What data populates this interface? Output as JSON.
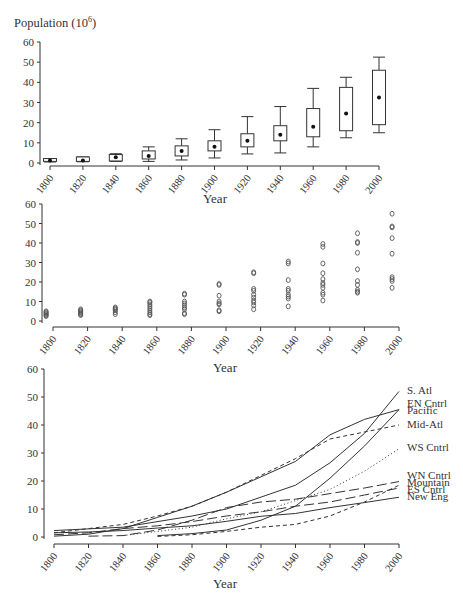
{
  "figure": {
    "title_text": "Population (10",
    "title_exp": "6",
    "title_close": ")"
  },
  "chart_data": [
    {
      "id": "boxplot",
      "type": "box",
      "title": "Population (10^6)",
      "xlabel": "Year",
      "ylabel": "Population (10^6)",
      "ylim": [
        0,
        60
      ],
      "yticks": [
        0,
        10,
        20,
        30,
        40,
        50,
        60
      ],
      "xticks": [
        1800,
        1820,
        1840,
        1860,
        1880,
        1900,
        1920,
        1940,
        1960,
        1980,
        2000
      ],
      "grid": false,
      "boxes": [
        {
          "x": 1800,
          "min": 0.5,
          "q1": 0.8,
          "mean": 1.2,
          "q3": 2.2,
          "max": 2.2
        },
        {
          "x": 1820,
          "min": 0.6,
          "q1": 0.8,
          "mean": 1.3,
          "q3": 3.0,
          "max": 3.0
        },
        {
          "x": 1840,
          "min": 0.8,
          "q1": 1.0,
          "mean": 2.8,
          "q3": 4.2,
          "max": 4.6
        },
        {
          "x": 1860,
          "min": 0.8,
          "q1": 2.0,
          "mean": 3.5,
          "q3": 6.0,
          "max": 8.0
        },
        {
          "x": 1880,
          "min": 1.5,
          "q1": 3.5,
          "mean": 6.0,
          "q3": 8.5,
          "max": 12.0
        },
        {
          "x": 1900,
          "min": 2.5,
          "q1": 6.0,
          "mean": 8.0,
          "q3": 11.0,
          "max": 16.5
        },
        {
          "x": 1920,
          "min": 4.5,
          "q1": 8.0,
          "mean": 11.0,
          "q3": 14.5,
          "max": 23.0
        },
        {
          "x": 1940,
          "min": 5.0,
          "q1": 11.0,
          "mean": 14.0,
          "q3": 18.5,
          "max": 28.0
        },
        {
          "x": 1960,
          "min": 8.0,
          "q1": 13.0,
          "mean": 18.0,
          "q3": 27.0,
          "max": 37.0
        },
        {
          "x": 1980,
          "min": 12.5,
          "q1": 16.0,
          "mean": 24.5,
          "q3": 37.5,
          "max": 42.5
        },
        {
          "x": 2000,
          "min": 15.0,
          "q1": 19.0,
          "mean": 32.5,
          "q3": 46.0,
          "max": 52.5
        }
      ],
      "layout": {
        "x0": 50,
        "x1": 379,
        "xaxis_y": 166,
        "yaxis_x": 40,
        "y_at_0": 163,
        "y_at_60": 42,
        "xlabel_x": 215,
        "xlabel_y": 203
      }
    },
    {
      "id": "scatter",
      "type": "scatter",
      "xlabel": "Year",
      "ylim": [
        0,
        60
      ],
      "yticks": [
        0,
        10,
        20,
        30,
        40,
        50,
        60
      ],
      "xticks": [
        1800,
        1820,
        1840,
        1860,
        1880,
        1900,
        1920,
        1940,
        1960,
        1980,
        2000
      ],
      "grid": false,
      "marker": "open-circle",
      "points": [
        {
          "x": 1796,
          "y": [
            2.5,
            3.0,
            3.5,
            4.0,
            4.5,
            5.0
          ]
        },
        {
          "x": 1816,
          "y": [
            3.0,
            3.5,
            4.0,
            4.5,
            5.0,
            5.5,
            6.0
          ]
        },
        {
          "x": 1836,
          "y": [
            3.5,
            4.5,
            5.5,
            6.0,
            6.5,
            7.0
          ]
        },
        {
          "x": 1856,
          "y": [
            3.0,
            3.5,
            4.5,
            5.5,
            6.5,
            7.5,
            8.5,
            9.5,
            10.0
          ]
        },
        {
          "x": 1876,
          "y": [
            3.5,
            4.0,
            6.0,
            7.0,
            8.0,
            9.0,
            10.0,
            13.5,
            14.0
          ]
        },
        {
          "x": 1896,
          "y": [
            5.0,
            5.5,
            8.5,
            9.0,
            10.0,
            13.0,
            18.5,
            19.0
          ]
        },
        {
          "x": 1916,
          "y": [
            6.0,
            8.0,
            9.5,
            10.5,
            12.0,
            13.5,
            15.5,
            16.5,
            24.5,
            25.0
          ]
        },
        {
          "x": 1936,
          "y": [
            7.5,
            11.5,
            12.5,
            13.5,
            15.5,
            16.5,
            21.0,
            29.5,
            30.5
          ]
        },
        {
          "x": 1956,
          "y": [
            10.5,
            13.5,
            14.5,
            17.0,
            18.5,
            19.5,
            21.5,
            24.5,
            29.5,
            38.0,
            39.5
          ]
        },
        {
          "x": 1976,
          "y": [
            14.5,
            15.0,
            16.0,
            18.5,
            20.5,
            26.5,
            35.0,
            40.0,
            40.5,
            45.0
          ]
        },
        {
          "x": 1996,
          "y": [
            17.0,
            20.5,
            21.5,
            22.5,
            34.5,
            42.5,
            48.0,
            48.5,
            55.0
          ]
        }
      ],
      "layout": {
        "x0": 53,
        "x1": 399,
        "xaxis_y": 327,
        "yaxis_x": 42,
        "y_at_0": 321,
        "y_at_60": 204,
        "xlabel_x": 225,
        "xlabel_y": 372
      }
    },
    {
      "id": "lines",
      "type": "line",
      "xlabel": "Year",
      "ylim": [
        0,
        60
      ],
      "yticks": [
        0,
        10,
        20,
        30,
        40,
        50,
        60
      ],
      "xticks": [
        1800,
        1820,
        1840,
        1860,
        1880,
        1900,
        1920,
        1940,
        1960,
        1980,
        2000
      ],
      "grid": false,
      "legend_position": "right (direct labels)",
      "series": [
        {
          "name": "S. Atl",
          "style": "solid",
          "label_y": 52.5,
          "x": [
            1800,
            1840,
            1880,
            1900,
            1940,
            1960,
            1980,
            2000
          ],
          "values": [
            2.3,
            3.5,
            7.5,
            10.0,
            18.5,
            26.5,
            37.0,
            52.0
          ]
        },
        {
          "name": "EN Cntrl",
          "style": "solid",
          "label_y": 48.0,
          "x": [
            1800,
            1820,
            1840,
            1860,
            1880,
            1900,
            1920,
            1940,
            1960,
            1980,
            2000
          ],
          "values": [
            0.3,
            1.0,
            3.0,
            7.0,
            11.0,
            16.0,
            21.5,
            27.0,
            36.5,
            42.0,
            45.5
          ]
        },
        {
          "name": "Pacific",
          "style": "solid",
          "label_y": 45.5,
          "x": [
            1860,
            1880,
            1900,
            1920,
            1940,
            1960,
            1980,
            2000
          ],
          "values": [
            0.5,
            1.2,
            2.5,
            6.0,
            11.0,
            21.0,
            32.5,
            45.5
          ]
        },
        {
          "name": "Mid-Atl",
          "style": "dashed",
          "label_y": 40.5,
          "x": [
            1800,
            1820,
            1840,
            1860,
            1880,
            1900,
            1920,
            1940,
            1960,
            1980,
            2000
          ],
          "values": [
            1.5,
            3.0,
            4.5,
            7.5,
            11.0,
            16.0,
            22.0,
            28.0,
            35.0,
            37.5,
            40.0
          ]
        },
        {
          "name": "WS Cntrl",
          "style": "dotted",
          "label_y": 32.0,
          "x": [
            1840,
            1860,
            1880,
            1900,
            1920,
            1940,
            1960,
            1980,
            2000
          ],
          "values": [
            0.5,
            2.0,
            3.5,
            6.5,
            9.0,
            13.0,
            17.0,
            23.5,
            31.5
          ]
        },
        {
          "name": "WN Cntrl",
          "style": "long-dash",
          "label_y": 22.0,
          "x": [
            1820,
            1840,
            1860,
            1880,
            1900,
            1920,
            1940,
            1960,
            1980,
            2000
          ],
          "values": [
            0.3,
            0.5,
            2.5,
            6.0,
            10.5,
            12.5,
            13.5,
            15.5,
            17.5,
            19.8
          ]
        },
        {
          "name": "Mountain",
          "style": "dashed",
          "label_y": 19.5,
          "x": [
            1860,
            1880,
            1900,
            1920,
            1940,
            1960,
            1980,
            2000
          ],
          "values": [
            0.2,
            0.8,
            2.0,
            3.5,
            4.5,
            7.5,
            12.5,
            18.5
          ]
        },
        {
          "name": "ES Cntrl",
          "style": "long-dash",
          "label_y": 17.0,
          "x": [
            1800,
            1820,
            1840,
            1860,
            1880,
            1900,
            1920,
            1940,
            1960,
            1980,
            2000
          ],
          "values": [
            0.8,
            1.5,
            3.0,
            4.0,
            5.5,
            7.5,
            9.0,
            11.0,
            12.5,
            15.0,
            17.5
          ]
        },
        {
          "name": "New Eng",
          "style": "solid",
          "label_y": 14.5,
          "x": [
            1800,
            1820,
            1840,
            1860,
            1880,
            1900,
            1920,
            1940,
            1960,
            1980,
            2000
          ],
          "values": [
            1.5,
            1.8,
            2.3,
            3.2,
            4.0,
            5.6,
            7.4,
            8.4,
            10.5,
            12.3,
            14.2
          ]
        }
      ],
      "layout": {
        "x0": 54,
        "x1": 399,
        "xaxis_y": 544,
        "yaxis_x": 44,
        "y_at_0": 537,
        "y_at_60": 369,
        "xlabel_x": 225,
        "xlabel_y": 588,
        "label_x": 407
      }
    }
  ]
}
